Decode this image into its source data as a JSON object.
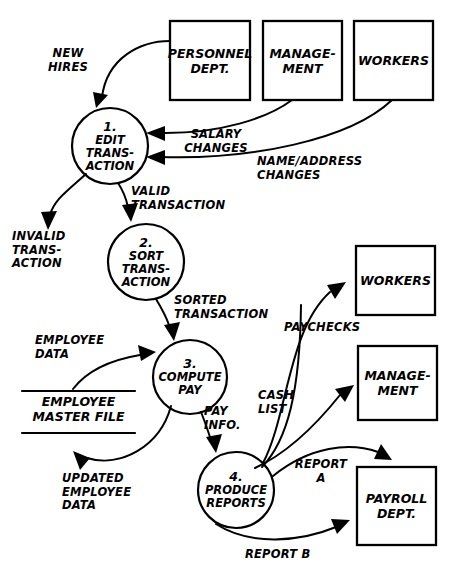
{
  "diagram": {
    "type": "data-flow-diagram",
    "stroke_color": "#000000",
    "background_color": "#ffffff"
  },
  "external_entities": [
    {
      "id": "personnel-dept",
      "label": "PERSONNEL\nDEPT."
    },
    {
      "id": "management-top",
      "label": "MANAGE-\nMENT"
    },
    {
      "id": "workers-top",
      "label": "WORKERS"
    },
    {
      "id": "workers-right",
      "label": "WORKERS"
    },
    {
      "id": "management-right",
      "label": "MANAGE-\nMENT"
    },
    {
      "id": "payroll-dept",
      "label": "PAYROLL\nDEPT."
    }
  ],
  "processes": [
    {
      "id": "process-1",
      "number": "1.",
      "label": "EDIT\nTRANS-\nACTION"
    },
    {
      "id": "process-2",
      "number": "2.",
      "label": "SORT\nTRANS-\nACTION"
    },
    {
      "id": "process-3",
      "number": "3.",
      "label": "COMPUTE\nPAY"
    },
    {
      "id": "process-4",
      "number": "4.",
      "label": "PRODUCE\nREPORTS"
    }
  ],
  "data_stores": [
    {
      "id": "employee-master-file",
      "label": "EMPLOYEE\nMASTER FILE"
    }
  ],
  "data_flows": [
    {
      "id": "new-hires",
      "label": "NEW\nHIRES"
    },
    {
      "id": "salary-changes",
      "label": "SALARY\nCHANGES"
    },
    {
      "id": "name-address-changes",
      "label": "NAME/ADDRESS\nCHANGES"
    },
    {
      "id": "invalid-transaction",
      "label": "INVALID\nTRANS-\nACTION"
    },
    {
      "id": "valid-transaction",
      "label": "VALID\nTRANSACTION"
    },
    {
      "id": "sorted-transaction",
      "label": "SORTED\nTRANSACTION"
    },
    {
      "id": "employee-data",
      "label": "EMPLOYEE\nDATA"
    },
    {
      "id": "updated-employee-data",
      "label": "UPDATED\nEMPLOYEE\nDATA"
    },
    {
      "id": "pay-info",
      "label": "PAY\nINFO."
    },
    {
      "id": "paychecks",
      "label": "PAYCHECKS"
    },
    {
      "id": "cash-list",
      "label": "CASH\nLIST"
    },
    {
      "id": "report-a",
      "label": "REPORT\nA"
    },
    {
      "id": "report-b",
      "label": "REPORT B"
    }
  ]
}
